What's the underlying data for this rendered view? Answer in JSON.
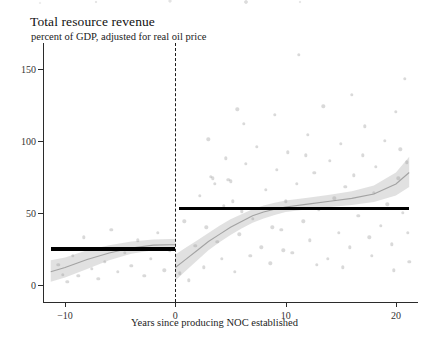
{
  "figure": {
    "title": "Total resource revenue",
    "subtitle": "percent of GDP, adjusted for real oil price"
  },
  "chart_data": {
    "type": "scatter",
    "title": "Total resource revenue",
    "subtitle": "percent of GDP, adjusted for real oil price",
    "xlabel": "Years since producing NOC established",
    "ylabel": "",
    "xlim": [
      -12,
      22
    ],
    "ylim": [
      -12,
      168
    ],
    "grid": false,
    "legend": null,
    "xticks": [
      -10,
      0,
      10,
      20
    ],
    "xticklabels": [
      "−10",
      "0",
      "10",
      "20"
    ],
    "yticks": [
      0,
      50,
      100,
      150
    ],
    "yticklabels": [
      "0",
      "50",
      "100",
      "150"
    ],
    "cutoff": {
      "x": 0,
      "style": "dashed",
      "color": "#1a1a1a",
      "label": "producing NOC established"
    },
    "step_levels": [
      {
        "name": "pre-NOC mean",
        "x_start": -11.3,
        "x_end": 0,
        "value": 25,
        "color": "#000000"
      },
      {
        "name": "post-NOC mean",
        "x_start": 0.3,
        "x_end": 21.2,
        "value": 53,
        "color": "#000000"
      }
    ],
    "fit_curves": [
      {
        "name": "loess fit (pre-period)",
        "color": "#8e8e8e",
        "band_color": "#c9c9c9",
        "x": [
          -11.3,
          -10,
          -8,
          -6,
          -4,
          -2,
          -0.5,
          0
        ],
        "y": [
          9,
          12,
          17.5,
          22,
          25.5,
          27.5,
          27.8,
          27.8
        ],
        "band_low": [
          2,
          5,
          11,
          17,
          21.5,
          24,
          24.5,
          24.5
        ],
        "band_high": [
          17,
          19,
          24,
          27.5,
          30,
          31.5,
          31.8,
          31.8
        ]
      },
      {
        "name": "loess fit (post-period)",
        "color": "#8e8e8e",
        "band_color": "#c9c9c9",
        "x": [
          0,
          1,
          2,
          3,
          4,
          5,
          6,
          7,
          8,
          9,
          10,
          12,
          14,
          16,
          18,
          20,
          21.2
        ],
        "y": [
          12,
          18,
          24,
          30,
          35,
          40,
          44,
          48,
          50.5,
          52.5,
          54,
          56,
          58,
          60,
          63,
          70,
          78
        ],
        "band_low": [
          3,
          10,
          17,
          24,
          29.5,
          34.5,
          39,
          43,
          46,
          48.5,
          50.5,
          52.5,
          54,
          55.5,
          57.5,
          62,
          68
        ],
        "band_high": [
          21,
          26,
          31,
          36,
          41,
          45.5,
          49,
          52.5,
          55,
          57,
          58.5,
          60.5,
          62.5,
          65,
          69,
          78,
          89
        ]
      }
    ],
    "points": [
      {
        "x": -10.6,
        "y": 14
      },
      {
        "x": -10.2,
        "y": 7
      },
      {
        "x": -9.8,
        "y": 2
      },
      {
        "x": -9.3,
        "y": 20
      },
      {
        "x": -8.8,
        "y": 6
      },
      {
        "x": -8.3,
        "y": 33
      },
      {
        "x": -7.6,
        "y": 11
      },
      {
        "x": -7.0,
        "y": 4
      },
      {
        "x": -6.4,
        "y": 16
      },
      {
        "x": -5.8,
        "y": 38
      },
      {
        "x": -5.2,
        "y": 9
      },
      {
        "x": -4.6,
        "y": 22
      },
      {
        "x": -4.0,
        "y": 13
      },
      {
        "x": -3.4,
        "y": 31
      },
      {
        "x": -2.8,
        "y": 6
      },
      {
        "x": -2.2,
        "y": 18
      },
      {
        "x": -1.6,
        "y": 36
      },
      {
        "x": -1.0,
        "y": 10
      },
      {
        "x": -0.5,
        "y": 24
      },
      {
        "x": 0.4,
        "y": 8
      },
      {
        "x": 0.8,
        "y": 44
      },
      {
        "x": 1.2,
        "y": 3
      },
      {
        "x": 1.8,
        "y": 27
      },
      {
        "x": 2.2,
        "y": 62
      },
      {
        "x": 2.6,
        "y": 12
      },
      {
        "x": 3.0,
        "y": 101
      },
      {
        "x": 3.2,
        "y": 75
      },
      {
        "x": 3.4,
        "y": 74
      },
      {
        "x": 3.6,
        "y": 70
      },
      {
        "x": 3.8,
        "y": 30
      },
      {
        "x": 4.2,
        "y": 18
      },
      {
        "x": 4.6,
        "y": 88
      },
      {
        "x": 4.8,
        "y": 73
      },
      {
        "x": 5.0,
        "y": 72
      },
      {
        "x": 5.2,
        "y": 58
      },
      {
        "x": 5.4,
        "y": 9
      },
      {
        "x": 5.8,
        "y": 35
      },
      {
        "x": 6.2,
        "y": 112
      },
      {
        "x": 6.4,
        "y": 84
      },
      {
        "x": 6.8,
        "y": 20
      },
      {
        "x": 7.0,
        "y": 46
      },
      {
        "x": 7.4,
        "y": 96
      },
      {
        "x": 7.8,
        "y": 26
      },
      {
        "x": 8.2,
        "y": 66
      },
      {
        "x": 8.6,
        "y": 15
      },
      {
        "x": 9.0,
        "y": 118
      },
      {
        "x": 9.2,
        "y": 80
      },
      {
        "x": 9.6,
        "y": 38
      },
      {
        "x": 10.0,
        "y": 58
      },
      {
        "x": 10.2,
        "y": 92
      },
      {
        "x": 10.6,
        "y": 22
      },
      {
        "x": 11.0,
        "y": 70
      },
      {
        "x": 11.2,
        "y": 160
      },
      {
        "x": 11.6,
        "y": 44
      },
      {
        "x": 12.0,
        "y": 104
      },
      {
        "x": 12.2,
        "y": 31
      },
      {
        "x": 12.6,
        "y": 78
      },
      {
        "x": 13.0,
        "y": 52
      },
      {
        "x": 13.4,
        "y": 124
      },
      {
        "x": 13.8,
        "y": 18
      },
      {
        "x": 14.0,
        "y": 86
      },
      {
        "x": 14.4,
        "y": 60
      },
      {
        "x": 14.8,
        "y": 36
      },
      {
        "x": 15.0,
        "y": 98
      },
      {
        "x": 15.4,
        "y": 68
      },
      {
        "x": 15.8,
        "y": 26
      },
      {
        "x": 16.0,
        "y": 132
      },
      {
        "x": 16.2,
        "y": 76
      },
      {
        "x": 16.6,
        "y": 48
      },
      {
        "x": 17.0,
        "y": 90
      },
      {
        "x": 17.2,
        "y": 110
      },
      {
        "x": 17.6,
        "y": 33
      },
      {
        "x": 18.0,
        "y": 64
      },
      {
        "x": 18.2,
        "y": 82
      },
      {
        "x": 18.6,
        "y": 41
      },
      {
        "x": 19.0,
        "y": 100
      },
      {
        "x": 19.2,
        "y": 56
      },
      {
        "x": 19.6,
        "y": 28
      },
      {
        "x": 20.0,
        "y": 120
      },
      {
        "x": 20.2,
        "y": 74
      },
      {
        "x": 20.4,
        "y": 94
      },
      {
        "x": 20.6,
        "y": 50
      },
      {
        "x": 20.8,
        "y": 143
      },
      {
        "x": 21.0,
        "y": 85
      },
      {
        "x": 21.1,
        "y": 36
      },
      {
        "x": 21.2,
        "y": 16
      },
      {
        "x": 5.6,
        "y": 122
      },
      {
        "x": 8.8,
        "y": 40
      },
      {
        "x": 12.8,
        "y": 14
      },
      {
        "x": 6.0,
        "y": 51
      },
      {
        "x": 9.8,
        "y": 24
      },
      {
        "x": 15.2,
        "y": 12
      },
      {
        "x": 17.8,
        "y": 20
      },
      {
        "x": 19.8,
        "y": 10
      },
      {
        "x": 4.4,
        "y": 55
      },
      {
        "x": 2.8,
        "y": 40
      },
      {
        "x": 11.8,
        "y": 90
      }
    ]
  }
}
